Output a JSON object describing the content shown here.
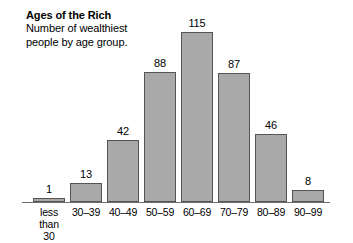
{
  "chart_data": {
    "type": "bar",
    "title": "Ages of the Rich",
    "subtitle_lines": [
      "Number of wealthiest",
      "people by age group."
    ],
    "categories": [
      "less than 30",
      "30–39",
      "40–49",
      "50–59",
      "60–69",
      "70–79",
      "80–89",
      "90–99"
    ],
    "category_lines": [
      [
        "less",
        "than",
        "30"
      ],
      [
        "30–39"
      ],
      [
        "40–49"
      ],
      [
        "50–59"
      ],
      [
        "60–69"
      ],
      [
        "70–79"
      ],
      [
        "80–89"
      ],
      [
        "90–99"
      ]
    ],
    "values": [
      1,
      13,
      42,
      88,
      115,
      87,
      46,
      8
    ],
    "value_labels": [
      "1",
      "13",
      "42",
      "88",
      "115",
      "87",
      "46",
      "8"
    ],
    "xlabel": "",
    "ylabel": "",
    "ylim": [
      0,
      115
    ],
    "grid": false,
    "legend": false,
    "axis_visible": "x-only"
  },
  "style": {
    "background": "#ffffff",
    "bar_fill": "#a9a9a9",
    "bar_stroke": "#555555",
    "axis_color": "#6e6e6e",
    "text_color": "#000000"
  }
}
